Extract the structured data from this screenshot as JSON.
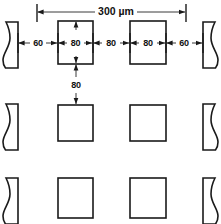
{
  "diagram": {
    "units_label": "300 µm",
    "overall_dimension": {
      "label": "300 µm",
      "value": 300,
      "unit": "µm",
      "orientation": "horizontal"
    },
    "horizontal_dimensions": [
      {
        "label": "60",
        "value": 60,
        "unit": "µm",
        "span": "left-break-to-square-1"
      },
      {
        "label": "80",
        "value": 80,
        "unit": "µm",
        "span": "square-1-width"
      },
      {
        "label": "80",
        "value": 80,
        "unit": "µm",
        "span": "gap-square-1-to-square-2"
      },
      {
        "label": "80",
        "value": 80,
        "unit": "µm",
        "span": "square-2-width"
      },
      {
        "label": "60",
        "value": 60,
        "unit": "µm",
        "span": "square-2-to-right-break"
      }
    ],
    "vertical_dimensions": [
      {
        "label": "80",
        "value": 80,
        "unit": "µm",
        "span": "gap-row-1-to-row-2"
      }
    ],
    "grid": {
      "rows": 3,
      "columns": 4,
      "row_labels": [
        "row-1",
        "row-2",
        "row-3"
      ],
      "column_labels": [
        "break-left",
        "square-1",
        "square-2",
        "break-right"
      ]
    },
    "colors": {
      "outline": "#1a1a1a",
      "dimension_line": "#3a3a3a",
      "fill": "#ffffff",
      "text": "#111111"
    }
  }
}
